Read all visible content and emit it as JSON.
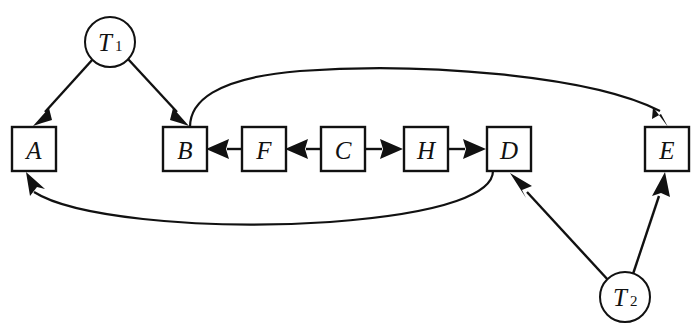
{
  "diagram": {
    "background_color": "#ffffff",
    "stroke_color": "#111111",
    "nodes": [
      {
        "id": "T1",
        "shape": "circle",
        "label": "T",
        "subscript": "1",
        "cx": 110,
        "cy": 42,
        "r": 25
      },
      {
        "id": "T2",
        "shape": "circle",
        "label": "T",
        "subscript": "2",
        "cx": 625,
        "cy": 297,
        "r": 25
      },
      {
        "id": "A",
        "shape": "box",
        "label": "A",
        "x": 12,
        "y": 127,
        "w": 44,
        "h": 44
      },
      {
        "id": "B",
        "shape": "box",
        "label": "B",
        "x": 163,
        "y": 127,
        "w": 44,
        "h": 44
      },
      {
        "id": "F",
        "shape": "box",
        "label": "F",
        "x": 242,
        "y": 127,
        "w": 44,
        "h": 44
      },
      {
        "id": "C",
        "shape": "box",
        "label": "C",
        "x": 321,
        "y": 127,
        "w": 44,
        "h": 44
      },
      {
        "id": "H",
        "shape": "box",
        "label": "H",
        "x": 404,
        "y": 127,
        "w": 44,
        "h": 44
      },
      {
        "id": "D",
        "shape": "box",
        "label": "D",
        "x": 487,
        "y": 127,
        "w": 44,
        "h": 44
      },
      {
        "id": "E",
        "shape": "box",
        "label": "E",
        "x": 645,
        "y": 127,
        "w": 44,
        "h": 44
      }
    ],
    "edges": [
      {
        "id": "T1-A",
        "from": "T1",
        "to": "A",
        "style": "straight",
        "arrow": "to"
      },
      {
        "id": "T1-B",
        "from": "T1",
        "to": "B",
        "style": "straight",
        "arrow": "to"
      },
      {
        "id": "F-B",
        "from": "F",
        "to": "B",
        "style": "straight",
        "arrow": "to"
      },
      {
        "id": "C-F",
        "from": "C",
        "to": "F",
        "style": "straight",
        "arrow": "to"
      },
      {
        "id": "C-H",
        "from": "C",
        "to": "H",
        "style": "straight",
        "arrow": "to"
      },
      {
        "id": "H-D",
        "from": "H",
        "to": "D",
        "style": "straight",
        "arrow": "to"
      },
      {
        "id": "B-E",
        "from": "B",
        "to": "E",
        "style": "curve-over-top",
        "arrow": "to"
      },
      {
        "id": "D-A",
        "from": "D",
        "to": "A",
        "style": "curve-under-bottom",
        "arrow": "to"
      },
      {
        "id": "T2-D",
        "from": "T2",
        "to": "D",
        "style": "straight",
        "arrow": "to"
      },
      {
        "id": "T2-E",
        "from": "T2",
        "to": "E",
        "style": "straight",
        "arrow": "to"
      }
    ]
  }
}
